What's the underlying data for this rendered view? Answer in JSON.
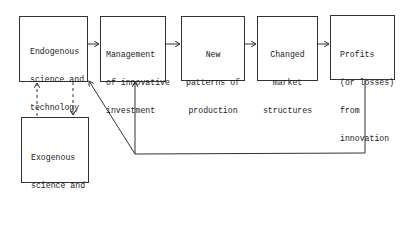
{
  "diagram": {
    "nodes": [
      {
        "id": "endogenous",
        "lines": [
          "Endogenous",
          "science and",
          "technology",
          "(mainly in-",
          "house R&D)"
        ]
      },
      {
        "id": "management",
        "lines": [
          "Management",
          "of innovative",
          "investment"
        ]
      },
      {
        "id": "new_patterns",
        "lines": [
          "New",
          "patterns of",
          "production"
        ]
      },
      {
        "id": "changed_market",
        "lines": [
          "Changed",
          "market",
          "structures"
        ]
      },
      {
        "id": "profits",
        "lines": [
          "Profits",
          "(or losses)",
          "from",
          "innovation"
        ]
      },
      {
        "id": "exogenous",
        "lines": [
          "Exogenous",
          "science and",
          "technology"
        ]
      }
    ],
    "edges": [
      {
        "from": "endogenous",
        "to": "management",
        "style": "solid"
      },
      {
        "from": "management",
        "to": "new_patterns",
        "style": "solid"
      },
      {
        "from": "new_patterns",
        "to": "changed_market",
        "style": "solid"
      },
      {
        "from": "changed_market",
        "to": "profits",
        "style": "solid"
      },
      {
        "from": "profits",
        "to": "management",
        "style": "solid-feedback"
      },
      {
        "from": "profits",
        "to": "endogenous",
        "style": "solid-feedback"
      },
      {
        "from": "exogenous",
        "to": "endogenous",
        "style": "dashed"
      },
      {
        "from": "endogenous",
        "to": "exogenous",
        "style": "dashed"
      }
    ],
    "colors": {
      "line": "#333333",
      "text": "#222222",
      "background": "#ffffff"
    }
  }
}
